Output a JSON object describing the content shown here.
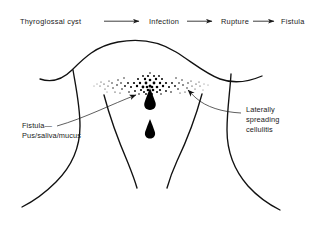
{
  "figure": {
    "background_color": "#ffffff",
    "ink_color": "#111111"
  },
  "flow": {
    "steps": [
      {
        "label": "Thyroglossal  cyst"
      },
      {
        "label": "Infection"
      },
      {
        "label": "Rupture"
      },
      {
        "label": "Fistula"
      }
    ],
    "arrow_name": "flow-arrow"
  },
  "annotations": {
    "left": {
      "name": "fistula-annotation",
      "lines": [
        "Fistula—",
        "Pus/saliva/mucus"
      ]
    },
    "right": {
      "name": "cellulitis-annotation",
      "lines": [
        "Laterally",
        "spreading",
        "cellulitis"
      ]
    }
  },
  "anatomy": {
    "name": "neck-outline",
    "features": [
      "jaw-line",
      "left-neck-contour",
      "right-neck-contour",
      "left-sternocleidomastoid",
      "right-sternocleidomastoid",
      "left-shoulder",
      "right-shoulder"
    ]
  },
  "lesion": {
    "name": "cellulitis-stipple-cloud",
    "description": "stippled inflammatory spread across midline neck"
  },
  "discharge": {
    "name": "discharge-droplets",
    "count": 2,
    "description": "droplets of pus, saliva and mucus"
  }
}
